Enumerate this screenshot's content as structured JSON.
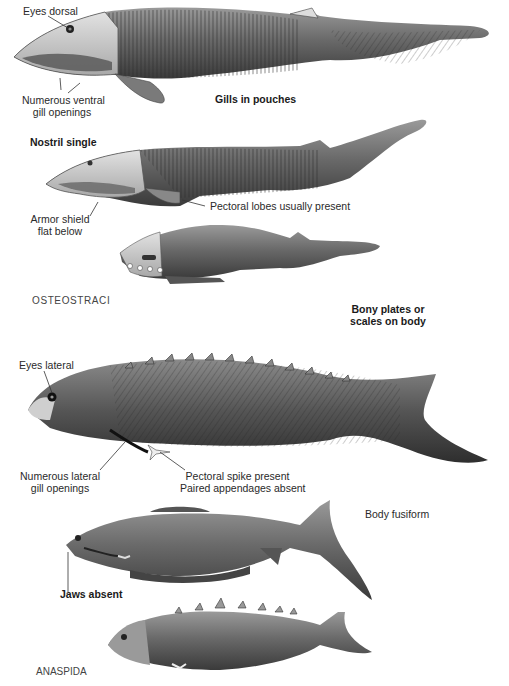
{
  "figure": {
    "colors": {
      "background": "#ffffff",
      "fish_body": "#6e6e6e",
      "fish_dark": "#333333",
      "fish_light": "#c8c8c8",
      "text": "#2a2a2a"
    },
    "groups": [
      {
        "name": "OSTEOSTRACI"
      },
      {
        "name": "ANASPIDA"
      }
    ],
    "labels": {
      "eyes_dorsal": "Eyes dorsal",
      "ventral_gill_1": "Numerous ventral",
      "ventral_gill_2": "gill openings",
      "gills_in_pouches": "Gills in pouches",
      "nostril_single": "Nostril single",
      "armor_shield_1": "Armor shield",
      "armor_shield_2": "flat below",
      "pectoral_lobes": "Pectoral lobes usually present",
      "bony_plates_1": "Bony plates or",
      "bony_plates_2": "scales on body",
      "eyes_lateral": "Eyes lateral",
      "lateral_gill_1": "Numerous lateral",
      "lateral_gill_2": "gill openings",
      "pectoral_spike": "Pectoral spike present",
      "paired_absent": "Paired appendages absent",
      "body_fusiform": "Body fusiform",
      "jaws_absent": "Jaws absent"
    },
    "specimens": [
      {
        "id": "osteostracan-1",
        "group": "OSTEOSTRACI"
      },
      {
        "id": "osteostracan-2",
        "group": "OSTEOSTRACI"
      },
      {
        "id": "osteostracan-3",
        "group": "OSTEOSTRACI"
      },
      {
        "id": "anaspid-1",
        "group": "ANASPIDA"
      },
      {
        "id": "anaspid-2",
        "group": "ANASPIDA"
      },
      {
        "id": "anaspid-3",
        "group": "ANASPIDA"
      }
    ]
  }
}
